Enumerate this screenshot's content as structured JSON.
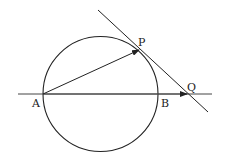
{
  "diagram": {
    "type": "geometry",
    "stroke_color": "#222222",
    "labels": {
      "A": "A",
      "B": "B",
      "P": "P",
      "Q": "Q"
    },
    "points": {
      "A": [
        43,
        94
      ],
      "B": [
        158,
        94
      ],
      "P": [
        139,
        50
      ],
      "Q": [
        188,
        94
      ]
    },
    "circle": {
      "center": [
        100.5,
        94
      ],
      "radius": 57.5
    },
    "vectors": [
      {
        "from": "A",
        "to": "P"
      },
      {
        "from": "A",
        "to": "Q"
      }
    ],
    "tangent_line": {
      "through": "P",
      "from": [
        98,
        10
      ],
      "to": [
        208,
        112
      ]
    }
  }
}
